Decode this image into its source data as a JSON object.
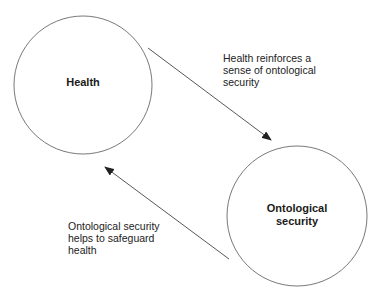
{
  "nodes": [
    {
      "id": "health",
      "label_lines": [
        "Health"
      ]
    },
    {
      "id": "ontological-security",
      "label_lines": [
        "Ontological",
        "security"
      ]
    }
  ],
  "edges": [
    {
      "from": "health",
      "to": "ontological-security",
      "label_lines": [
        "Health reinforces a",
        "sense of ontological",
        "security"
      ]
    },
    {
      "from": "ontological-security",
      "to": "health",
      "label_lines": [
        "Ontological security",
        "helps to safeguard",
        "health"
      ]
    }
  ],
  "colors": {
    "stroke": "#555555",
    "text": "#1a1a1a",
    "background": "#ffffff"
  }
}
